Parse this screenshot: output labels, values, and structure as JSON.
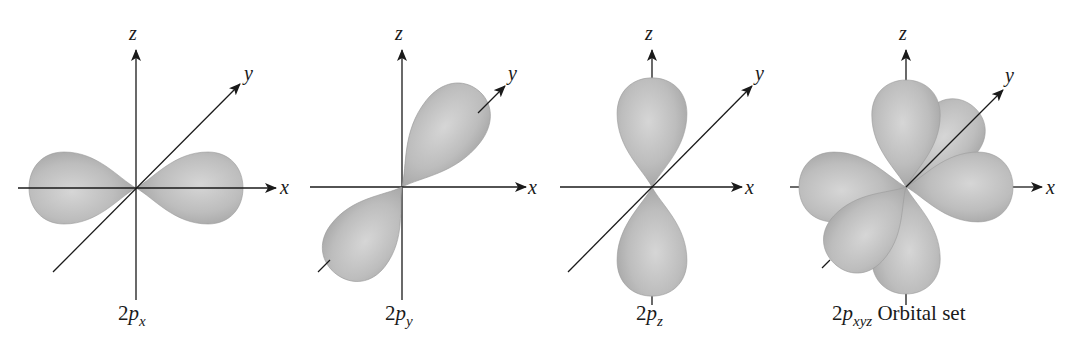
{
  "figure": {
    "panels": [
      {
        "id": "2px",
        "caption": {
          "prefix": "2",
          "letter": "p",
          "sub": "x",
          "suffix": ""
        },
        "axes": {
          "x": "x",
          "y": "y",
          "z": "z"
        }
      },
      {
        "id": "2py",
        "caption": {
          "prefix": "2",
          "letter": "p",
          "sub": "y",
          "suffix": ""
        },
        "axes": {
          "x": "x",
          "y": "y",
          "z": "z"
        }
      },
      {
        "id": "2pz",
        "caption": {
          "prefix": "2",
          "letter": "p",
          "sub": "z",
          "suffix": ""
        },
        "axes": {
          "x": "x",
          "y": "y",
          "z": "z"
        }
      },
      {
        "id": "2pxyz",
        "caption": {
          "prefix": "2",
          "letter": "p",
          "sub": "xyz",
          "suffix": " Orbital set"
        },
        "axes": {
          "x": "x",
          "y": "y",
          "z": "z"
        }
      }
    ],
    "colors": {
      "lobe_light": "#d4d4d4",
      "lobe_mid": "#b8b8b8",
      "lobe_dark": "#9c9c9c",
      "axis": "#1a1a1a"
    }
  }
}
